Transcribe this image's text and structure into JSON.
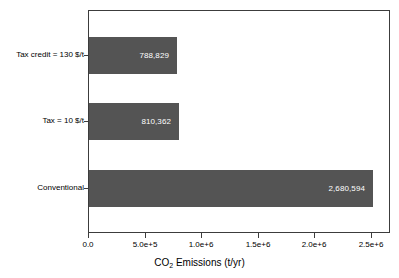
{
  "chart_data": {
    "type": "bar",
    "orientation": "horizontal",
    "title": "",
    "subtitle": "",
    "xlabel": "CO2 Emissions (t/yr)",
    "xlabel_prefix": "CO",
    "xlabel_sub": "2",
    "xlabel_suffix": " Emissions (t/yr)",
    "ylabel": "",
    "categories": [
      "Tax credit = 130 $/t",
      "Tax = 10 $/t",
      "Conventional"
    ],
    "values": [
      788829,
      810362,
      2680594
    ],
    "value_labels": [
      "788,829",
      "810,362",
      "2,680,594"
    ],
    "xlim": [
      0,
      2680594
    ],
    "axis_max": 2680594,
    "xticks": [
      0,
      500000,
      1000000,
      1500000,
      2000000,
      2500000
    ],
    "xticklabels": [
      "0.0",
      "5.0e+5",
      "1.0e+6",
      "1.5e+6",
      "2.0e+6",
      "2.5e+6"
    ],
    "grid": false,
    "legend": false,
    "legend_position": "none",
    "bar_color": "#545454",
    "bar_label_color": "#ffffff",
    "frame_color": "#3c3c3c",
    "background_color": "#ffffff"
  },
  "layout": {
    "bar_tops_px": [
      26,
      92,
      159
    ],
    "bar_widths_px": [
      88,
      90,
      284
    ],
    "tick_x_px": [
      88,
      145,
      201,
      258,
      314,
      371
    ],
    "category_center_px": [
      55,
      121,
      188
    ]
  }
}
